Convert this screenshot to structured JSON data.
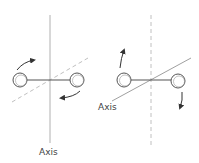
{
  "diagrams": [
    {
      "id": "left",
      "axis_label": "Axis",
      "axis_style": "solid-vertical",
      "secondary_line_style": "dashed-diagonal",
      "rotation": "about vertical axis"
    },
    {
      "id": "right",
      "axis_label": "Axis",
      "axis_style": "solid-diagonal",
      "secondary_line_style": "dashed-vertical",
      "rotation": "about diagonal axis"
    }
  ],
  "colors": {
    "axis_line": "#b0b0b0",
    "dashed_line": "#c0c0c0",
    "rod": "#555555",
    "circle_stroke": "#555555",
    "arrow": "#333333",
    "label": "#444444"
  }
}
